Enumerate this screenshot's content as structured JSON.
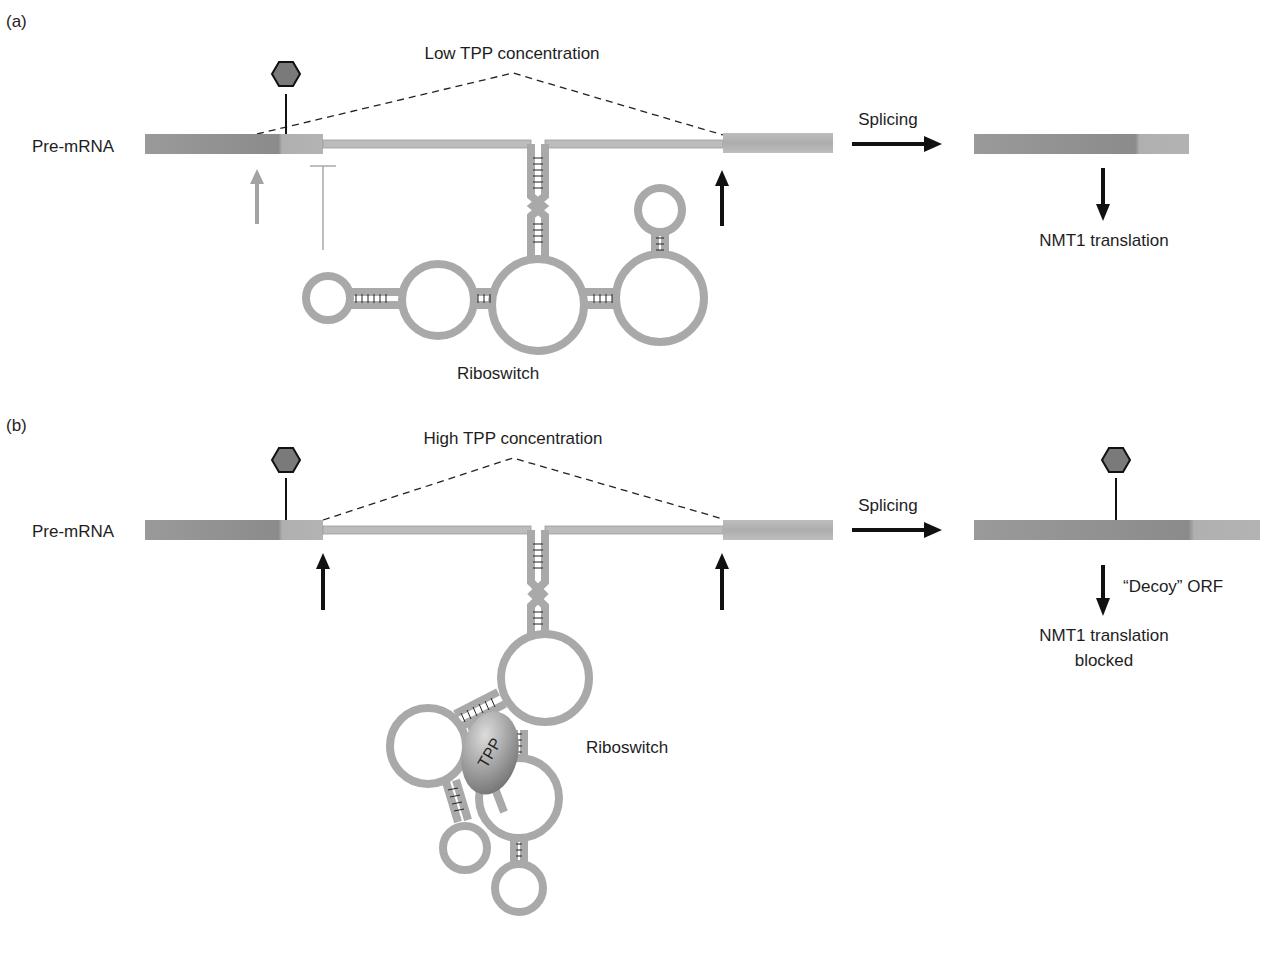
{
  "figure": {
    "panels": [
      {
        "id": "a",
        "panel_label": "(a)",
        "condition_label": "Low TPP concentration",
        "pre_mrna_label": "Pre-mRNA",
        "splicing_label": "Splicing",
        "riboswitch_label": "Riboswitch",
        "outcome_label": "NMT1 translation",
        "ligand_bound": false
      },
      {
        "id": "b",
        "panel_label": "(b)",
        "condition_label": "High TPP concentration",
        "pre_mrna_label": "Pre-mRNA",
        "splicing_label": "Splicing",
        "riboswitch_label": "Riboswitch",
        "ligand_label": "TPP",
        "decoy_label": "“Decoy” ORF",
        "outcome_label_line1": "NMT1 translation",
        "outcome_label_line2": "blocked",
        "ligand_bound": true
      }
    ],
    "icons": {
      "start-codon-marker": "hexagon-on-stem",
      "splice-site": "up-arrow",
      "inhibition": "t-bar"
    },
    "colors": {
      "exon_dark": "#8e8e8e",
      "exon_light": "#b4b4b4",
      "rna_strand": "#b9b9b9",
      "rna_strand_edge": "#8f8f8f",
      "hexagon_fill": "#7a7a7a",
      "tpp_fill": "#8a8a8a",
      "arrow": "#111111",
      "inactive_arrow": "#a0a0a0"
    }
  }
}
